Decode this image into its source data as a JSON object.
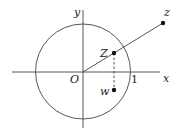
{
  "diagram": {
    "type": "complex-plane-unit-circle",
    "axes": {
      "x_label": "x",
      "y_label": "y",
      "origin_label": "O",
      "unit_label": "1"
    },
    "points": [
      {
        "name": "z",
        "label": "z"
      },
      {
        "name": "Z",
        "label": "Z"
      },
      {
        "name": "w",
        "label": "w"
      }
    ],
    "colors": {
      "stroke": "#333333",
      "background": "#ffffff"
    }
  }
}
